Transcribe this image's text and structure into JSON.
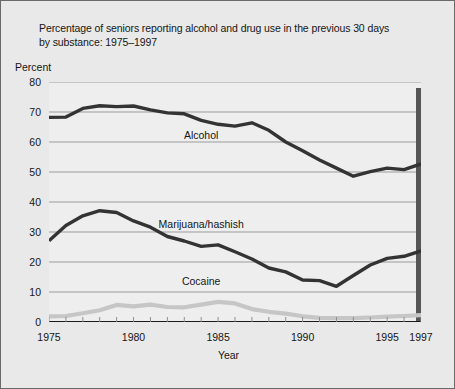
{
  "figure": {
    "title_line1": "Percentage of seniors reporting alcohol and drug use in the previous 30 days",
    "title_line2": "by substance: 1975–1997",
    "percent_label": "Percent",
    "xaxis_title": "Year",
    "background_color": "#e9e9e9",
    "border_color": "#6a6a6a"
  },
  "chart_data": {
    "type": "line",
    "title": "Percentage of seniors reporting alcohol and drug use in the previous 30 days by substance: 1975–1997",
    "xlabel": "Year",
    "ylabel": "Percent",
    "xlim": [
      1975,
      1997
    ],
    "ylim": [
      0,
      80
    ],
    "ytick_labels": [
      "0",
      "10",
      "20",
      "30",
      "40",
      "50",
      "60",
      "70",
      "80"
    ],
    "yticks": [
      0,
      10,
      20,
      30,
      40,
      50,
      60,
      70,
      80
    ],
    "xtick_labels": [
      "1975",
      "1980",
      "1985",
      "1990",
      "1995",
      "1997"
    ],
    "xticks": [
      1975,
      1980,
      1985,
      1990,
      1995,
      1997
    ],
    "grid": "horizontal",
    "legend": "inline-labels",
    "x": [
      1975,
      1976,
      1977,
      1978,
      1979,
      1980,
      1981,
      1982,
      1983,
      1984,
      1985,
      1986,
      1987,
      1988,
      1989,
      1990,
      1991,
      1992,
      1993,
      1994,
      1995,
      1996,
      1997
    ],
    "series": [
      {
        "name": "Alcohol",
        "color": "#333333",
        "width": 3.4,
        "label_x": 1984,
        "label_y": 62,
        "values": [
          68.2,
          68.3,
          71.2,
          72.1,
          71.8,
          72.0,
          70.7,
          69.7,
          69.4,
          67.2,
          65.9,
          65.3,
          66.4,
          63.9,
          60.0,
          57.1,
          54.0,
          51.3,
          48.6,
          50.1,
          51.3,
          50.8,
          52.7
        ]
      },
      {
        "name": "Marijuana/hashish",
        "color": "#333333",
        "width": 3.4,
        "label_x": 1984,
        "label_y": 32.5,
        "values": [
          27.1,
          32.2,
          35.4,
          37.1,
          36.5,
          33.7,
          31.6,
          28.5,
          27.0,
          25.2,
          25.7,
          23.4,
          21.0,
          18.0,
          16.7,
          14.0,
          13.8,
          11.9,
          15.5,
          19.0,
          21.2,
          21.9,
          23.7
        ]
      },
      {
        "name": "Cocaine",
        "color": "#c6c6c6",
        "width": 4.2,
        "label_x": 1984,
        "label_y": 13.5,
        "values": [
          1.9,
          2.0,
          2.9,
          3.9,
          5.7,
          5.2,
          5.8,
          5.0,
          4.9,
          5.8,
          6.7,
          6.2,
          4.3,
          3.4,
          2.8,
          1.9,
          1.4,
          1.3,
          1.3,
          1.5,
          1.8,
          2.0,
          2.3
        ]
      }
    ],
    "annotations": [
      {
        "name": "right-edge-marker",
        "x": 1997,
        "y_from": 0,
        "y_to": 78,
        "color": "#555555",
        "note": "thick vertical bar at plot right edge"
      }
    ]
  }
}
